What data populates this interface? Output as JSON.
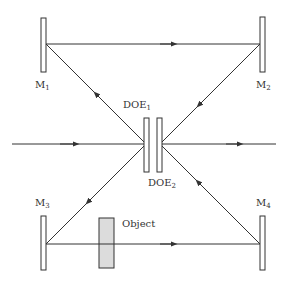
{
  "diagram": {
    "type": "optical-interferometer",
    "colors": {
      "line": "#333333",
      "mirror_fill": "#ffffff",
      "object_fill": "#dcdcdc",
      "background": "#ffffff"
    },
    "mirrors": [
      {
        "id": "M1",
        "label": "M",
        "sub": "1"
      },
      {
        "id": "M2",
        "label": "M",
        "sub": "2"
      },
      {
        "id": "M3",
        "label": "M",
        "sub": "3"
      },
      {
        "id": "M4",
        "label": "M",
        "sub": "4"
      }
    ],
    "does": [
      {
        "id": "DOE1",
        "label": "DOE",
        "sub": "1"
      },
      {
        "id": "DOE2",
        "label": "DOE",
        "sub": "2"
      }
    ],
    "object": {
      "label": "Object"
    }
  }
}
